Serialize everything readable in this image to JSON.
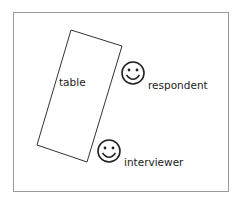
{
  "diagram": {
    "type": "seating-layout",
    "frame": {
      "border_color": "#9a9a9a"
    },
    "table": {
      "label": "table",
      "corners": [
        [
          71,
          30
        ],
        [
          122,
          46
        ],
        [
          87,
          162
        ],
        [
          37,
          145
        ]
      ],
      "stroke": "#333333"
    },
    "people": [
      {
        "role": "respondent",
        "label": "respondent",
        "icon": "smiley-face-icon",
        "cx": 133,
        "cy": 73,
        "r": 11
      },
      {
        "role": "interviewer",
        "label": "interviewer",
        "icon": "smiley-face-icon",
        "cx": 109,
        "cy": 151,
        "r": 11
      }
    ],
    "stroke_color": "#222222"
  }
}
